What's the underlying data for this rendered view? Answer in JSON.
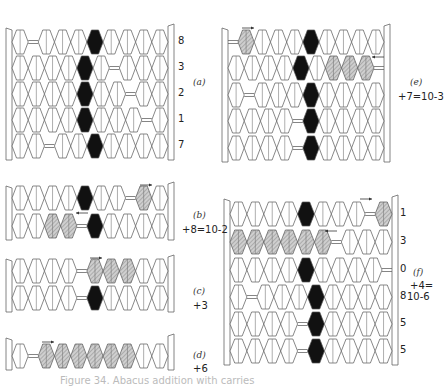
{
  "figure": {
    "caption": "Figure 34. Abacus addition with carries",
    "bead_colors": {
      "white": "#ffffff",
      "black": "#111111",
      "hatched": "#c8c8c8",
      "outline": "#555555"
    },
    "panels": [
      {
        "id": "a",
        "tag": "(a)",
        "expression": "",
        "frame": {
          "x": 12,
          "y": 26,
          "w": 156,
          "row_y": [
            42,
            68,
            94,
            120,
            146
          ]
        },
        "rows": [
          {
            "digit": "8",
            "beads": "W G W W W B W W W W"
          },
          {
            "digit": "3",
            "beads": "W W W W B W G W W W"
          },
          {
            "digit": "2",
            "beads": "W W W W B W W G W W"
          },
          {
            "digit": "1",
            "beads": "W W W W B W W W G W"
          },
          {
            "digit": "7",
            "beads": "W W G W W B W W W W"
          }
        ],
        "arrows": [],
        "tag_pos": [
          193,
          78
        ],
        "digit_x": 178
      },
      {
        "id": "e",
        "tag": "(e)",
        "expression": "+7=10-3",
        "frame": {
          "x": 228,
          "y": 26,
          "w": 156,
          "row_y": [
            42,
            68,
            95,
            121,
            148
          ]
        },
        "rows": [
          {
            "digit": "",
            "beads": "G H W W W B W W W W"
          },
          {
            "digit": "",
            "beads": "W W W W B W H H H G"
          },
          {
            "digit": "",
            "beads": "W G W W W B W W W W"
          },
          {
            "digit": "",
            "beads": "W W W W G B W W W W"
          },
          {
            "digit": "",
            "beads": "W W W W G B W W W W"
          }
        ],
        "arrows": [
          {
            "x": 242,
            "y": 26,
            "dir": "right"
          },
          {
            "x": 372,
            "y": 55,
            "dir": "left"
          }
        ],
        "tag_pos": [
          410,
          78
        ],
        "expr_pos": [
          398,
          92
        ],
        "digit_x": 0
      },
      {
        "id": "b",
        "tag": "(b)",
        "expression": "+8=10-2",
        "frame": {
          "x": 12,
          "y": 184,
          "w": 156,
          "row_y": [
            198,
            226
          ]
        },
        "rows": [
          {
            "digit": "",
            "beads": "W W W W B W W G H W"
          },
          {
            "digit": "",
            "beads": "W W H H G B W W W W"
          }
        ],
        "arrows": [
          {
            "x": 140,
            "y": 183,
            "dir": "right"
          },
          {
            "x": 76,
            "y": 211,
            "dir": "left"
          }
        ],
        "tag_pos": [
          193,
          211
        ],
        "expr_pos": [
          182,
          225
        ],
        "digit_x": 0
      },
      {
        "id": "c",
        "tag": "(c)",
        "expression": "+3",
        "frame": {
          "x": 12,
          "y": 257,
          "w": 156,
          "row_y": [
            271,
            298
          ]
        },
        "rows": [
          {
            "digit": "",
            "beads": "W W W W G H H H W W"
          },
          {
            "digit": "",
            "beads": "W W W W G B W W W W"
          }
        ],
        "arrows": [
          {
            "x": 90,
            "y": 256,
            "dir": "right"
          }
        ],
        "tag_pos": [
          193,
          287
        ],
        "expr_pos": [
          193,
          301
        ],
        "digit_x": 0
      },
      {
        "id": "d",
        "tag": "(d)",
        "expression": "+6",
        "frame": {
          "x": 12,
          "y": 336,
          "w": 156,
          "row_y": [
            356
          ]
        },
        "rows": [
          {
            "digit": "",
            "beads": "W G H H H H H H W W"
          }
        ],
        "arrows": [
          {
            "x": 42,
            "y": 340,
            "dir": "right"
          }
        ],
        "tag_pos": [
          193,
          351
        ],
        "expr_pos": [
          193,
          364
        ],
        "digit_x": 0
      },
      {
        "id": "f",
        "tag": "(f)",
        "expression": "+4=",
        "expression2": "10-6",
        "frame": {
          "x": 230,
          "y": 197,
          "w": 162,
          "row_y": [
            214,
            242,
            270,
            297,
            324,
            351
          ]
        },
        "rows": [
          {
            "digit": "1",
            "beads": "W W W W B W W W G H"
          },
          {
            "digit": "3",
            "beads": "H H H H H H G W W W"
          },
          {
            "digit": "0",
            "beads": "W W W W B W W W W G"
          },
          {
            "digit": "8",
            "beads": "W G W W W B W W W W"
          },
          {
            "digit": "5",
            "beads": "W W W W G B W W W W"
          },
          {
            "digit": "5",
            "beads": "W W W W G B W W W W"
          }
        ],
        "arrows": [
          {
            "x": 360,
            "y": 197,
            "dir": "right"
          },
          {
            "x": 325,
            "y": 229,
            "dir": "left"
          }
        ],
        "tag_pos": [
          413,
          268
        ],
        "expr_pos": [
          410,
          281
        ],
        "expr2_pos": [
          407,
          292
        ],
        "digit_x": 400
      }
    ]
  }
}
